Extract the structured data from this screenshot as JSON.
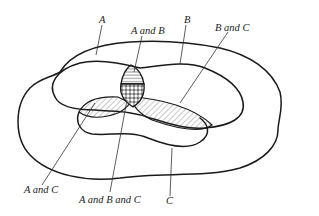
{
  "diagram": {
    "type": "venn-diagram",
    "sets": [
      {
        "id": "A",
        "label": "A",
        "shape": "outer-region"
      },
      {
        "id": "B",
        "label": "B",
        "shape": "middle-region"
      },
      {
        "id": "C",
        "label": "C",
        "shape": "lower-lens-region"
      }
    ],
    "labels": {
      "a": "A",
      "b": "B",
      "c": "C",
      "a_and_b": "A and B",
      "b_and_c": "B and C",
      "a_and_c": "A and C",
      "a_and_b_and_c": "A and B and C"
    },
    "regions": [
      {
        "name": "A and B",
        "fill": "horizontal-hatch"
      },
      {
        "name": "B and C",
        "fill": "diagonal-hatch"
      },
      {
        "name": "A and C",
        "fill": "diagonal-hatch"
      },
      {
        "name": "A and B and C",
        "fill": "crosshatch-dots"
      }
    ],
    "colors": {
      "stroke": "#1a1a1a",
      "background": "#ffffff"
    }
  }
}
